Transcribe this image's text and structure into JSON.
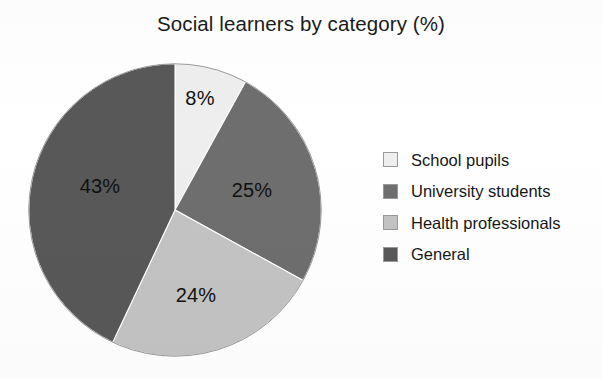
{
  "chart_data": {
    "type": "pie",
    "title": "Social learners by category (%)",
    "xlabel": "",
    "ylabel": "",
    "units": "%",
    "grid": false,
    "legend_position": "right",
    "start_angle_deg": 0,
    "direction": "clockwise",
    "categories": [
      "School pupils",
      "University students",
      "Health professionals",
      "General"
    ],
    "values": [
      8,
      25,
      24,
      43
    ],
    "labels": [
      "8%",
      "25%",
      "24%",
      "43%"
    ],
    "colors": [
      "#eeeeee",
      "#6e6e6e",
      "#c3c3c3",
      "#585858"
    ],
    "slices": [
      {
        "category": "School pupils",
        "value": 8,
        "label": "8%",
        "color": "#eeeeee",
        "start_deg": 0,
        "end_deg": 28.8,
        "label_x": 200,
        "label_y": 98
      },
      {
        "category": "University students",
        "value": 25,
        "label": "25%",
        "color": "#6e6e6e",
        "start_deg": 28.8,
        "end_deg": 118.8,
        "label_x": 252,
        "label_y": 190
      },
      {
        "category": "Health professionals",
        "value": 24,
        "label": "24%",
        "color": "#c3c3c3",
        "start_deg": 118.8,
        "end_deg": 205.2,
        "label_x": 196,
        "label_y": 295
      },
      {
        "category": "General",
        "value": 43,
        "label": "43%",
        "color": "#585858",
        "start_deg": 205.2,
        "end_deg": 360,
        "label_x": 100,
        "label_y": 186
      }
    ]
  },
  "legend": {
    "items": [
      {
        "label": "School pupils",
        "color": "#eeeeee"
      },
      {
        "label": "University students",
        "color": "#6e6e6e"
      },
      {
        "label": "Health professionals",
        "color": "#c3c3c3"
      },
      {
        "label": "General",
        "color": "#585858"
      }
    ]
  }
}
